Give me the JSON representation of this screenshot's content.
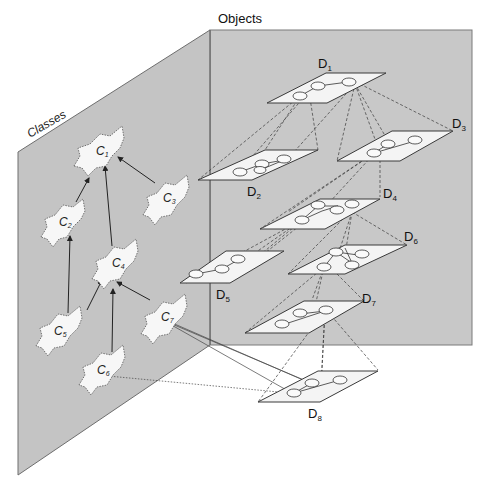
{
  "panels": {
    "classes_label": "Classes",
    "objects_label": "Objects"
  },
  "colors": {
    "panel_fill": "#c6c6c6",
    "panel_stroke": "#7a7a7a",
    "plane_fill": "#f4f4f4",
    "node_fill": "#f7f7f7",
    "edge": "#333333"
  },
  "classes": [
    {
      "id": "C1",
      "base": "C",
      "sub": "1",
      "x": 102,
      "y": 152
    },
    {
      "id": "C2",
      "base": "C",
      "sub": "2",
      "x": 65,
      "y": 221
    },
    {
      "id": "C3",
      "base": "C",
      "sub": "3",
      "x": 167,
      "y": 199
    },
    {
      "id": "C4",
      "base": "C",
      "sub": "4",
      "x": 116,
      "y": 263
    },
    {
      "id": "C5",
      "base": "C",
      "sub": "5",
      "x": 60,
      "y": 330
    },
    {
      "id": "C6",
      "base": "C",
      "sub": "6",
      "x": 103,
      "y": 369
    },
    {
      "id": "C7",
      "base": "C",
      "sub": "7",
      "x": 165,
      "y": 318
    }
  ],
  "class_edges": [
    {
      "from": "C2",
      "to": "C1"
    },
    {
      "from": "C3",
      "to": "C1"
    },
    {
      "from": "C4",
      "to": "C1"
    },
    {
      "from": "C5",
      "to": "C2"
    },
    {
      "from": "C5",
      "to": "C4"
    },
    {
      "from": "C6",
      "to": "C4"
    },
    {
      "from": "C7",
      "to": "C4"
    }
  ],
  "objects": [
    {
      "id": "D1",
      "base": "D",
      "sub": "1"
    },
    {
      "id": "D2",
      "base": "D",
      "sub": "2"
    },
    {
      "id": "D3",
      "base": "D",
      "sub": "3"
    },
    {
      "id": "D4",
      "base": "D",
      "sub": "4"
    },
    {
      "id": "D5",
      "base": "D",
      "sub": "5"
    },
    {
      "id": "D6",
      "base": "D",
      "sub": "6"
    },
    {
      "id": "D7",
      "base": "D",
      "sub": "7"
    },
    {
      "id": "D8",
      "base": "D",
      "sub": "8"
    }
  ]
}
